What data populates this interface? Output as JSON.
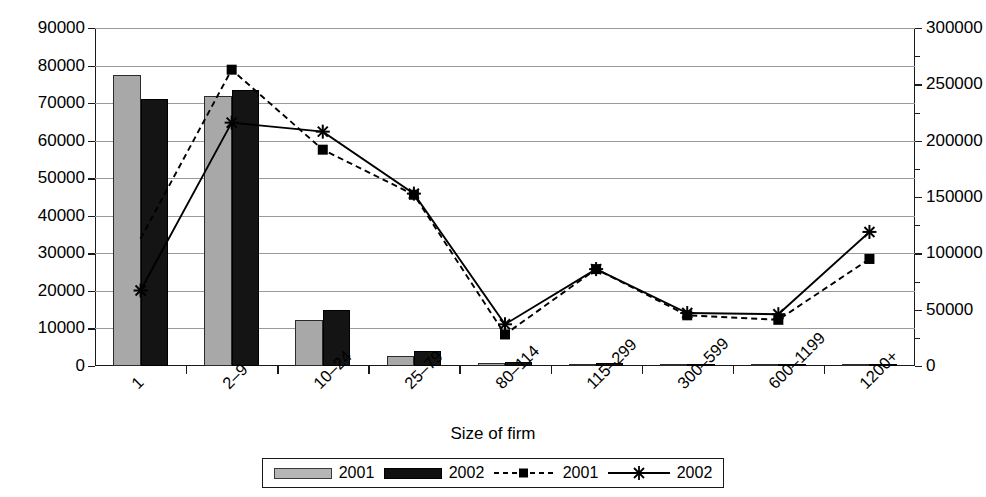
{
  "chart_data": {
    "type": "bar",
    "title": "",
    "xlabel": "Size of firm",
    "ylabel": "",
    "ylabel_right": "",
    "categories": [
      "1",
      "2–9",
      "10–24",
      "25–79",
      "80–114",
      "115–299",
      "300–599",
      "600–1199",
      "1200+"
    ],
    "ylim": [
      0,
      90000
    ],
    "ylim_right": [
      0,
      300000
    ],
    "yticks": [
      0,
      10000,
      20000,
      30000,
      40000,
      50000,
      60000,
      70000,
      80000,
      90000
    ],
    "yticks_right": [
      0,
      50000,
      100000,
      150000,
      200000,
      250000,
      300000
    ],
    "grid": true,
    "legend_position": "bottom",
    "series": [
      {
        "name": "2001",
        "kind": "bar",
        "axis": "left",
        "color": "#a8a8a8",
        "values": [
          77500,
          72000,
          12300,
          2700,
          900,
          500,
          150,
          80,
          60
        ]
      },
      {
        "name": "2002",
        "kind": "bar",
        "axis": "left",
        "color": "#141414",
        "values": [
          71200,
          73500,
          14800,
          4000,
          1200,
          700,
          200,
          110,
          90
        ]
      },
      {
        "name": "2001",
        "kind": "line-dashed",
        "axis": "right",
        "marker": "square",
        "color": "#000000",
        "values": [
          113000,
          263000,
          192000,
          152000,
          28000,
          86000,
          45000,
          41000,
          95000
        ]
      },
      {
        "name": "2002",
        "kind": "line-solid",
        "axis": "right",
        "marker": "asterisk",
        "color": "#000000",
        "values": [
          67000,
          216000,
          208000,
          153000,
          37000,
          86000,
          47000,
          46000,
          119000
        ]
      }
    ]
  },
  "axes": {
    "left_ticks": [
      "0",
      "10000",
      "20000",
      "30000",
      "40000",
      "50000",
      "60000",
      "70000",
      "80000",
      "90000"
    ],
    "right_ticks": [
      "0",
      "50000",
      "100000",
      "150000",
      "200000",
      "250000",
      "300000"
    ],
    "x_title": "Size of firm",
    "categories": [
      "1",
      "2–9",
      "10–24",
      "25–79",
      "80–114",
      "115–299",
      "300–599",
      "600–1199",
      "1200+"
    ]
  },
  "legend": {
    "items": [
      {
        "label": "2001",
        "type": "bar-gray"
      },
      {
        "label": "2002",
        "type": "bar-black"
      },
      {
        "label": "2001",
        "type": "line-dashed-square"
      },
      {
        "label": "2002",
        "type": "line-solid-asterisk"
      }
    ]
  }
}
